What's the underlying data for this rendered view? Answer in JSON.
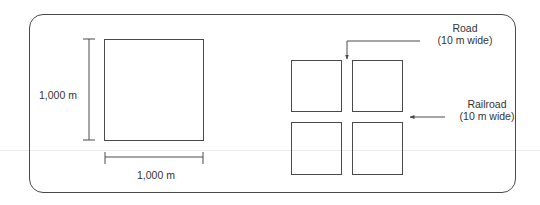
{
  "diagram": {
    "left_panel": {
      "description": "Single large square parcel",
      "height_label": "1,000 m",
      "width_label": "1,000 m"
    },
    "right_panel": {
      "description": "Square parcel divided into four quadrants by a road and a railroad",
      "quadrants": [
        "top-left",
        "top-right",
        "bottom-left",
        "bottom-right"
      ],
      "road_label": {
        "line1": "Road",
        "line2": "(10 m wide)"
      },
      "railroad_label": {
        "line1": "Railroad",
        "line2": "(10 m wide)"
      }
    },
    "colors": {
      "stroke": "#4a4a4a",
      "text": "#333333",
      "background": "#ffffff"
    }
  }
}
